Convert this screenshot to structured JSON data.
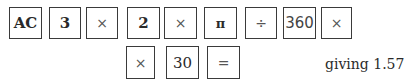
{
  "sequence": {
    "row1": [
      {
        "label": "AC",
        "icon": null
      },
      {
        "label": "3",
        "icon": null
      },
      {
        "label": "×",
        "icon": "multiply-icon"
      },
      {
        "label": "2",
        "icon": null
      },
      {
        "label": "×",
        "icon": "multiply-icon"
      },
      {
        "label": "π",
        "icon": "pi-icon"
      },
      {
        "label": "÷",
        "icon": "divide-icon"
      },
      {
        "label": "360",
        "icon": null
      },
      {
        "label": "×",
        "icon": "multiply-icon"
      }
    ],
    "row2": [
      {
        "label": "×",
        "icon": "multiply-icon"
      },
      {
        "label": "30",
        "icon": null
      },
      {
        "label": "=",
        "icon": "equals-icon"
      }
    ]
  },
  "result_text": "giving 1.57",
  "colors": {
    "border": "#3a3a3a",
    "text": "#2a2a2a",
    "background": "#ffffff"
  }
}
